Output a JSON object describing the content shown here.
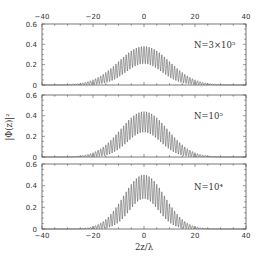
{
  "chart_data": {
    "type": "line",
    "layout": "3 vertically stacked panels sharing x-axis",
    "xlabel": "2z/λ",
    "ylabel": "|Φ(z)|²",
    "xlim": [
      -40,
      40
    ],
    "ylim": [
      0,
      0.6
    ],
    "x_ticks": [
      -40,
      -20,
      0,
      20,
      40
    ],
    "x_tick_labels": [
      "−40",
      "−20",
      "0",
      "20",
      "40"
    ],
    "y_ticks": [
      0,
      0.2,
      0.4,
      0.6
    ],
    "y_tick_labels": [
      "0",
      "0.2",
      "0.4",
      "0.6"
    ],
    "top_axis_labels_shown": true,
    "grid": false,
    "panels": [
      {
        "annotation": "N=3×10⁵",
        "description": "Rapidly oscillating curve under a Gaussian-like envelope centered at 0",
        "upper_envelope_peak": 0.38,
        "lower_envelope_peak": 0.21,
        "envelope_halfwidth_to_zero": 26,
        "oscillation_period": 1
      },
      {
        "annotation": "N=10⁵",
        "description": "Rapidly oscillating curve under a Gaussian-like envelope centered at 0",
        "upper_envelope_peak": 0.44,
        "lower_envelope_peak": 0.24,
        "envelope_halfwidth_to_zero": 24,
        "oscillation_period": 1
      },
      {
        "annotation": "N=10⁴",
        "description": "Rapidly oscillating curve under a Gaussian-like envelope centered at 0",
        "upper_envelope_peak": 0.5,
        "lower_envelope_peak": 0.28,
        "envelope_halfwidth_to_zero": 21,
        "oscillation_period": 1
      }
    ]
  },
  "labels": {
    "xlabel": "2z/λ",
    "ylabel": "|Φ(z)|²",
    "panel_1_annotation": "N=3×10⁵",
    "panel_2_annotation": "N=10⁵",
    "panel_3_annotation": "N=10⁴"
  },
  "style": {
    "frame_color": "#555555",
    "curve_color": "#333333",
    "text_color": "#333333"
  }
}
